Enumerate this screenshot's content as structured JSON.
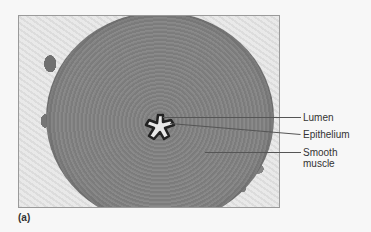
{
  "figure": {
    "panel_letter": "(a)",
    "image_description": "Light micrograph cross-section of a tubular organ with thick smooth muscle wall and star-shaped lumen",
    "labels": [
      {
        "id": "lumen",
        "text": "Lumen"
      },
      {
        "id": "epithelium",
        "text": "Epithelium"
      },
      {
        "id": "smooth_muscle_line1",
        "text": "Smooth"
      },
      {
        "id": "smooth_muscle_line2",
        "text": "muscle"
      }
    ]
  }
}
